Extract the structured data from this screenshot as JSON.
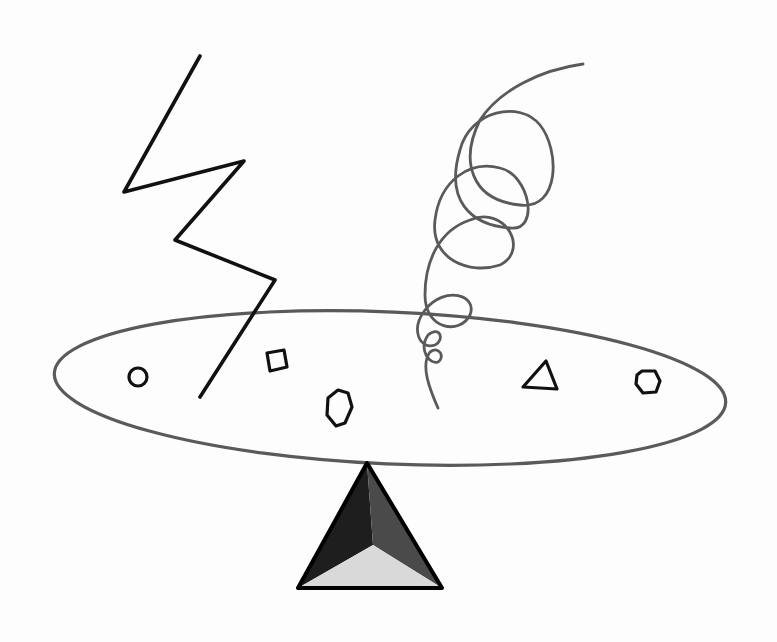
{
  "drawing": {
    "background": "#fdfdfd",
    "ink_color": "#111111",
    "pencil_color": "#5a5a5a",
    "lightning_bolt": {
      "points": "200,56 124,192 244,161 175,240 275,280 200,397"
    },
    "spring": {
      "path": "M583,64 C540,70 500,90 480,120 C460,160 470,200 520,205 C560,210 560,150 540,125 C520,100 470,110 460,150 C445,200 470,225 510,228 C540,232 530,175 500,168 C470,160 440,180 435,220 C430,260 470,275 500,265 C530,250 505,205 470,220 C440,230 425,260 425,295 C425,330 460,335 470,315 C478,295 445,285 425,310 C410,330 420,350 435,345 C445,340 440,325 428,335 C418,350 430,365 438,362 C445,358 440,345 430,352 C420,365 430,390 438,408"
    },
    "ellipse": {
      "cx": 390,
      "cy": 388,
      "rx": 336,
      "ry": 76,
      "rotate": 2.5
    },
    "shapes": [
      {
        "type": "circle",
        "cx": 138,
        "cy": 377,
        "r": 9
      },
      {
        "type": "square",
        "points": "267,353 284,350 287,367 270,371"
      },
      {
        "type": "hexagon",
        "points": "338,390 348,393 352,407 345,423 336,426 327,415 328,398"
      },
      {
        "type": "triangle",
        "points": "546,361 557,389 523,387"
      },
      {
        "type": "heptagon",
        "points": "642,371 655,371 660,381 656,392 643,393 636,384 637,375"
      }
    ],
    "fulcrum": {
      "apex": [
        367,
        463
      ],
      "left": [
        298,
        588
      ],
      "right": [
        442,
        588
      ],
      "center": [
        373,
        545
      ],
      "left_face_color": "#1e1e1e",
      "right_face_color": "#4a4a4a",
      "bottom_face_color": "#d9d9d9"
    }
  }
}
